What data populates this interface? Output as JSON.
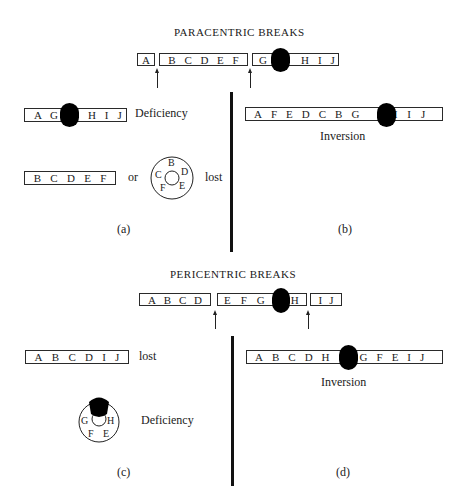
{
  "paracentric": {
    "title": "PARACENTRIC BREAKS",
    "original": {
      "seg1": [
        "A"
      ],
      "seg2": [
        "B",
        "C",
        "D",
        "E",
        "F"
      ],
      "seg3_left": [
        "G"
      ],
      "seg3_right": [
        "H",
        "I",
        "J"
      ]
    },
    "panel_a": {
      "deficiency_left": [
        "A",
        "G"
      ],
      "deficiency_right": [
        "H",
        "I",
        "J"
      ],
      "deficiency_label": "Deficiency",
      "fragment": [
        "B",
        "C",
        "D",
        "E",
        "F"
      ],
      "or_label": "or",
      "ring": [
        "B",
        "D",
        "E",
        "F",
        "C"
      ],
      "lost_label": "lost",
      "caption": "(a)"
    },
    "panel_b": {
      "inversion_left": [
        "A",
        "F",
        "E",
        "D",
        "C",
        "B",
        "G"
      ],
      "inversion_right": [
        "H",
        "I",
        "J"
      ],
      "inversion_label": "Inversion",
      "caption": "(b)"
    }
  },
  "pericentric": {
    "title": "PERICENTRIC BREAKS",
    "original": {
      "seg1": [
        "A",
        "B",
        "C",
        "D"
      ],
      "seg2_left": [
        "E",
        "F",
        "G"
      ],
      "seg2_right": [
        "H"
      ],
      "seg3": [
        "I",
        "J"
      ]
    },
    "panel_c": {
      "fragment": [
        "A",
        "B",
        "C",
        "D",
        "I",
        "J"
      ],
      "lost_label": "lost",
      "ring": [
        "G",
        "H",
        "E",
        "F"
      ],
      "deficiency_label": "Deficiency",
      "caption": "(c)"
    },
    "panel_d": {
      "inversion_left": [
        "A",
        "B",
        "C",
        "D",
        "H"
      ],
      "inversion_right": [
        "G",
        "F",
        "E",
        "I",
        "J"
      ],
      "inversion_label": "Inversion",
      "caption": "(d)"
    }
  },
  "colors": {
    "centromere": "#000000",
    "line": "#2a2a2a",
    "background": "#ffffff"
  }
}
